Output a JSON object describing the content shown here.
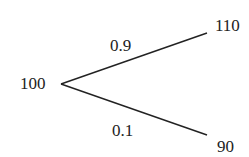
{
  "tree": {
    "root": {
      "value": "100"
    },
    "branches": [
      {
        "probability": "0.9",
        "outcome": "110"
      },
      {
        "probability": "0.1",
        "outcome": "90"
      }
    ]
  },
  "colors": {
    "line": "#222222",
    "text": "#222222",
    "background": "#ffffff"
  }
}
